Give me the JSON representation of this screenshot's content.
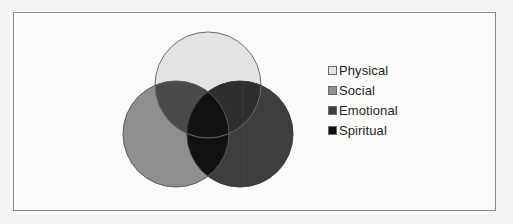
{
  "diagram": {
    "type": "venn",
    "sets": [
      {
        "label": "Physical",
        "color": "#e3e3e3",
        "cx": 208,
        "cy": 85,
        "r": 53
      },
      {
        "label": "Social",
        "color": "#8f8f8f",
        "cx": 176,
        "cy": 134,
        "r": 53
      },
      {
        "label": "Emotional",
        "color": "#3e3e3e",
        "cx": 240,
        "cy": 134,
        "r": 53
      }
    ],
    "overlaps": {
      "physical_social": "#4a4a4a",
      "physical_emotional": "#2e2e2e",
      "social_emotional": "#141414",
      "all": "#0e0e0e"
    },
    "center_color": "#111111"
  },
  "legend": {
    "items": [
      {
        "label": "Physical",
        "color": "#e3e3e3"
      },
      {
        "label": "Social",
        "color": "#8f8f8f"
      },
      {
        "label": "Emotional",
        "color": "#3e3e3e"
      },
      {
        "label": "Spiritual",
        "color": "#111111"
      }
    ]
  }
}
